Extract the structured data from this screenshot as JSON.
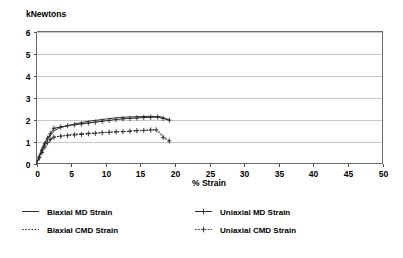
{
  "chart_data": {
    "type": "line",
    "title": "",
    "xlabel": "% Strain",
    "ylabel": "kNewtons",
    "xlim": [
      0,
      50
    ],
    "ylim": [
      0,
      6
    ],
    "xticks": [
      0,
      5,
      10,
      15,
      20,
      25,
      30,
      35,
      40,
      45,
      50
    ],
    "yticks": [
      0,
      1,
      2,
      3,
      4,
      5,
      6
    ],
    "xtick_labels": [
      "0",
      "5",
      "10",
      "15",
      "20",
      "25",
      "30",
      "35",
      "40",
      "45",
      "50"
    ],
    "ytick_labels": [
      "0",
      "1",
      "2",
      "3",
      "4",
      "5",
      "6"
    ],
    "grid": "horizontal",
    "legend_position": "bottom",
    "series": [
      {
        "name": "Biaxial MD Strain",
        "style": "solid",
        "marker": "none",
        "x": [
          0,
          0.3,
          0.6,
          1.0,
          1.4,
          1.8,
          2.2,
          2.6,
          3.2,
          4.0,
          5.0,
          6.0,
          7.0,
          8.0,
          9.0,
          10.0,
          11.0,
          12.0,
          13.0,
          14.0,
          15.0,
          16.0,
          17.0,
          18.0,
          18.6,
          19.2
        ],
        "y": [
          0.0,
          0.25,
          0.55,
          0.85,
          1.05,
          1.2,
          1.35,
          1.5,
          1.6,
          1.68,
          1.76,
          1.83,
          1.89,
          1.94,
          1.98,
          2.02,
          2.06,
          2.09,
          2.11,
          2.12,
          2.13,
          2.14,
          2.14,
          2.12,
          2.05,
          1.98
        ]
      },
      {
        "name": "Biaxial CMD Strain",
        "style": "dotted",
        "marker": "none",
        "x": [
          0,
          0.3,
          0.6,
          1.0,
          1.4,
          1.8,
          2.2,
          2.6,
          3.2,
          4.0,
          5.0,
          6.0,
          7.0,
          8.0,
          9.0,
          10.0,
          11.0,
          12.0,
          13.0,
          14.0,
          15.0,
          16.0,
          17.0,
          17.6,
          18.4,
          19.2
        ],
        "y": [
          0.0,
          0.2,
          0.45,
          0.7,
          0.88,
          1.0,
          1.1,
          1.18,
          1.24,
          1.28,
          1.32,
          1.35,
          1.37,
          1.39,
          1.4,
          1.42,
          1.43,
          1.45,
          1.46,
          1.48,
          1.5,
          1.52,
          1.53,
          1.5,
          1.22,
          1.02
        ]
      },
      {
        "name": "Uniaxial MD Strain",
        "style": "solid",
        "marker": "plus",
        "x": [
          0,
          0.4,
          0.8,
          1.2,
          1.6,
          2.0,
          2.5,
          3.5,
          4.5,
          5.5,
          6.5,
          7.5,
          8.5,
          9.5,
          10.5,
          11.5,
          12.5,
          13.5,
          14.5,
          15.5,
          16.5,
          17.5,
          18.3,
          19.2
        ],
        "y": [
          0.0,
          0.3,
          0.6,
          0.9,
          1.15,
          1.35,
          1.6,
          1.66,
          1.72,
          1.76,
          1.8,
          1.84,
          1.88,
          1.92,
          1.96,
          2.0,
          2.03,
          2.05,
          2.07,
          2.09,
          2.1,
          2.11,
          2.05,
          1.97
        ]
      },
      {
        "name": "Uniaxial CMD Strain",
        "style": "dotted",
        "marker": "plus",
        "x": [
          0,
          0.4,
          0.8,
          1.2,
          1.6,
          2.0,
          2.5,
          3.5,
          4.5,
          5.5,
          6.5,
          7.5,
          8.5,
          9.5,
          10.5,
          11.5,
          12.5,
          13.5,
          14.5,
          15.5,
          16.5,
          17.3,
          18.3,
          19.2
        ],
        "y": [
          0.0,
          0.25,
          0.5,
          0.75,
          0.95,
          1.1,
          1.2,
          1.24,
          1.27,
          1.3,
          1.32,
          1.35,
          1.37,
          1.4,
          1.42,
          1.44,
          1.45,
          1.47,
          1.49,
          1.5,
          1.52,
          1.53,
          1.18,
          1.02
        ]
      }
    ]
  },
  "legend": {
    "items": [
      {
        "label": "Biaxial MD Strain",
        "style": "solid",
        "marker": "none"
      },
      {
        "label": "Uniaxial MD Strain",
        "style": "solid",
        "marker": "plus"
      },
      {
        "label": "Biaxial CMD Strain",
        "style": "dotted",
        "marker": "none"
      },
      {
        "label": "Uniaxial CMD Strain",
        "style": "dotted",
        "marker": "plus"
      }
    ]
  },
  "colors": {
    "series": "#2b2b2b",
    "grid": "#c9c9c9",
    "frame": "#6b6b6b",
    "background": "#ffffff"
  }
}
